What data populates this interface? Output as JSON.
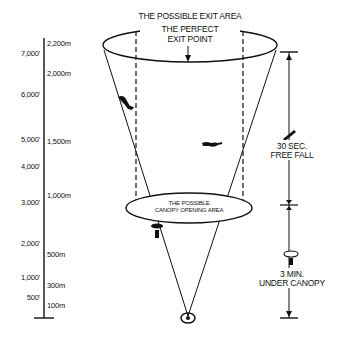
{
  "title": "THE POSSIBLE EXIT AREA",
  "exit_point": {
    "line1": "THE PERFECT",
    "line2": "EXIT POINT"
  },
  "canopy_area": {
    "line1": "THE POSSIBLE",
    "line2": "CANOPY OPENING AREA"
  },
  "free_fall": {
    "line1": "30 SEC.",
    "line2": "FREE FALL"
  },
  "under_canopy": {
    "line1": "3 MIN.",
    "line2": "UNDER CANOPY"
  },
  "altitude_scale": {
    "feet": [
      "7,000'",
      "6,000'",
      "5,000'",
      "4,000'",
      "3,000'",
      "2,000'",
      "1,000'",
      "500'"
    ],
    "meters": [
      "2,200m",
      "2,000m",
      "1,500m",
      "1,000m",
      "500m",
      "300m",
      "100m"
    ]
  },
  "icons": [
    "skydiver-tracking-icon",
    "skydiver-freefall-icon",
    "parachutist-canopy-icon",
    "landing-target-icon"
  ]
}
